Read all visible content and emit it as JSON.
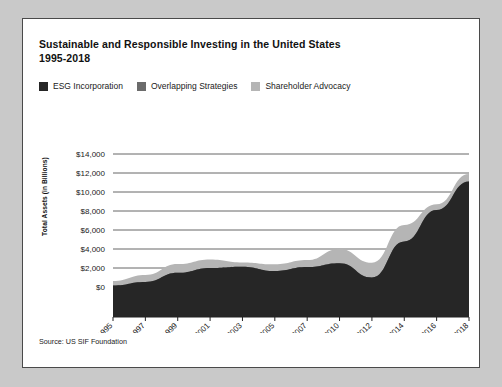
{
  "card": {
    "title": "Sustainable and Responsible Investing in the United States",
    "subtitle": "1995-2018",
    "source": "Source: US SIF Foundation"
  },
  "legend": {
    "position": "top-left",
    "items": [
      {
        "label": "ESG Incorporation",
        "color": "#262626",
        "icon": "legend-swatch-icon"
      },
      {
        "label": "Overlapping Strategies",
        "color": "#6b6b6b",
        "icon": "legend-swatch-icon"
      },
      {
        "label": "Shareholder Advocacy",
        "color": "#b5b5b5",
        "icon": "legend-swatch-icon"
      }
    ]
  },
  "chart_data": {
    "type": "area",
    "stacked": true,
    "title": "Sustainable and Responsible Investing in the United States 1995-2018",
    "xlabel": "",
    "ylabel": "Total Assets (in Billions)",
    "ylim": [
      0,
      14000
    ],
    "ytick_labels": [
      "$14,000",
      "$12,000",
      "$10,000",
      "$8,000",
      "$6,000",
      "$4,000",
      "$2,000",
      "$0"
    ],
    "ytick_values": [
      14000,
      12000,
      10000,
      8000,
      6000,
      4000,
      2000,
      0
    ],
    "grid": true,
    "grid_axis": "y",
    "legend_position": "top-left",
    "categories": [
      "1995",
      "1997",
      "1999",
      "2001",
      "2003",
      "2005",
      "2007",
      "2010",
      "2012",
      "2014",
      "2016",
      "2018"
    ],
    "series": [
      {
        "name": "ESG Incorporation",
        "color": "#262626",
        "values": [
          162,
          529,
          1497,
          2010,
          2143,
          1685,
          2098,
          2512,
          1013,
          4800,
          8100,
          11100
        ]
      },
      {
        "name": "Overlapping Strategies",
        "color": "#6b6b6b",
        "values": [
          0,
          0,
          0,
          0,
          0,
          0,
          0,
          0,
          0,
          0,
          0,
          0
        ]
      },
      {
        "name": "Shareholder Advocacy",
        "color": "#b5b5b5",
        "values": [
          473,
          736,
          922,
          897,
          448,
          703,
          739,
          1497,
          1536,
          1720,
          600,
          800
        ]
      }
    ],
    "totals": [
      639,
      1185,
      2159,
      2323,
      2164,
      2290,
      2711,
      3069,
      3744,
      6572,
      8723,
      11995
    ]
  },
  "axis": {
    "ytitle": "Total Assets (in Billions)"
  }
}
